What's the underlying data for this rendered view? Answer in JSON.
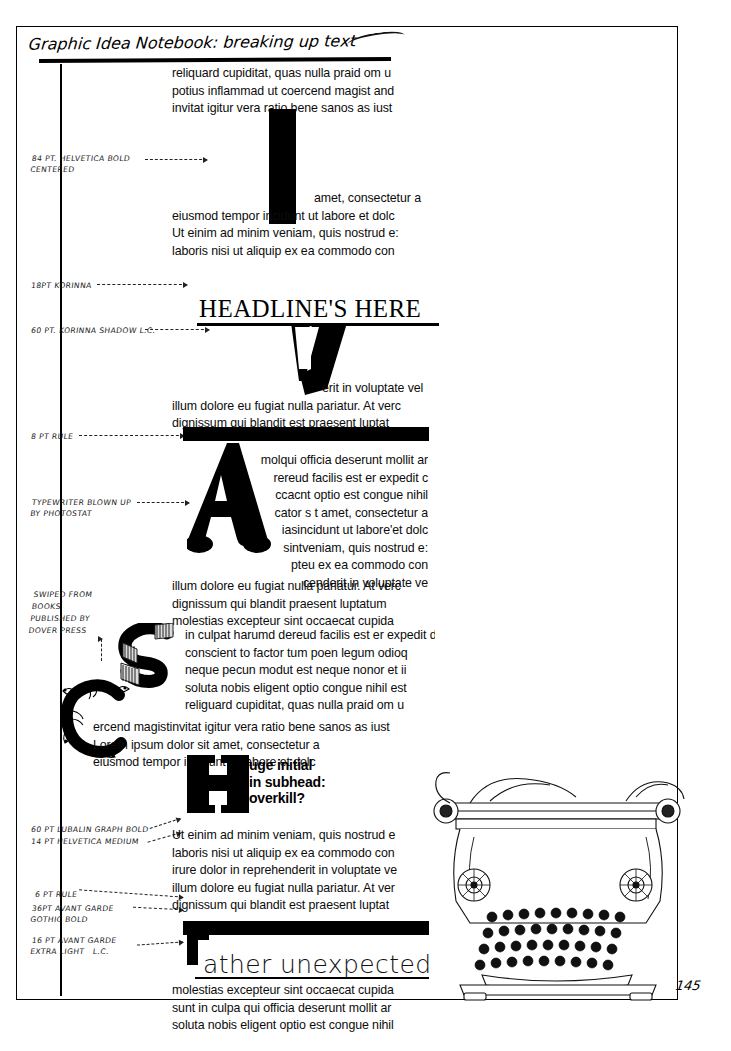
{
  "page": {
    "title_handwritten": "Graphic Idea Notebook: breaking up text",
    "folio": "145"
  },
  "annotations": [
    {
      "id": "helvetica-bold",
      "text": "84 pt. HELVETICA BOLD\nCENTERED"
    },
    {
      "id": "korinna-18",
      "text": "18PT KORINNA"
    },
    {
      "id": "korinna-shadow",
      "text": "60 pt. KORINNA SHADOW L.C."
    },
    {
      "id": "rule-8pt",
      "text": "8 pt RULE"
    },
    {
      "id": "typewriter-photostat",
      "text": "TYPEWRITER BLOWN UP\nBY PHOTOSTAT"
    },
    {
      "id": "dover-press",
      "text": "SWIPED FROM\nBOOKS\nPUBLISHED BY\nDOVER PRESS"
    },
    {
      "id": "lubalin-graph",
      "text": "60 PT LUBALIN GRAPH BOLD"
    },
    {
      "id": "helvetica-medium",
      "text": "14 PT HELVETICA MEDIUM"
    },
    {
      "id": "rule-6pt",
      "text": "6 pt RULE"
    },
    {
      "id": "avant-garde-bold",
      "text": "36PT AVANT GARDE\nGOTHIC BOLD"
    },
    {
      "id": "avant-garde-light",
      "text": "16 PT AVANT GARDE\nEXTRA LIGHT   L.C."
    }
  ],
  "blocks": {
    "intro": "reliquard cupiditat, quas nulla praid om u\npotius inflammad ut coercend magist and\ninvitat igitur vera ratio bene sanos as iust",
    "initial_i": "I",
    "after_i_first": "amet, consectetur a",
    "after_i": "eiusmod tempor incidunt ut labore et dolc\nUt einim ad minim veniam, quis nostrud e:\nlaboris nisi ut aliquip ex ea commodo con",
    "headline": "HEADLINE'S HERE",
    "initial_v": "V",
    "after_v_first": "erit in voluptate vel",
    "after_v": "illum dolore eu fugiat nulla pariatur. At verc\ndignissum qui blandit est praesent luptat",
    "initial_a": "A",
    "typewriter_wrap": "molqui officia deserunt mollit ar\nrereud facilis est er expedit c\nccacnt optio est congue nihil\ncator s t amet, consectetur a\niasincidunt ut labore'et dolc\nsintveniam, quis nostrud e:\npteu ex ea commodo con\ncenderit in voluptate ve",
    "after_a": "illum dolore eu fugiat nulla pariatur. At verc\ndignissum qui blandit praesent luptatum\nmolestias excepteur sint occaecat cupida",
    "initial_s": "S",
    "s_wrap": "in culpat harumd dereud facilis est er expedit dis\nconscient to factor tum poen legum odioq\nneque pecun modut est neque nonor et ii\nsoluta nobis eligent optio congue nihil est\nreliguard cupiditat, quas nulla praid om u",
    "initial_c": "C",
    "c_wrap": "ercend magistinvitat igitur vera ratio bene sanos as iust\nLorem ipsum dolor sit amet, consectetur a\neiusmod tempor incidunt ut labore et dolc",
    "initial_h": "H",
    "subhead": "uge initial\nin subhead:\noverkill?",
    "after_h": "Ut einim ad minim veniam, quis nostrud e\nlaboris nisi ut aliquip ex ea commodo con\nirure dolor in reprehenderit in voluptate ve\nillum dolore eu fugiat nulla pariatur. At ver\ndignissum qui blandit est praesent luptat",
    "initial_r": "r",
    "unexpected": "ather unexpected",
    "after_unexpected": "molestias excepteur sint occaecat cupida\nsunt in culpa qui officia deserunt mollit ar\nsoluta nobis eligent optio est congue nihil"
  },
  "colors": {
    "ink": "#000000",
    "paper": "#ffffff"
  }
}
